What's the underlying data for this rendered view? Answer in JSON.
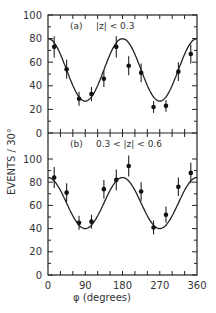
{
  "chart_data": [
    {
      "type": "scatter",
      "panel": "(a)",
      "label": "|z| < 0.3",
      "x": [
        15,
        45,
        75,
        105,
        135,
        165,
        195,
        225,
        255,
        285,
        315,
        345
      ],
      "values": [
        73,
        54,
        29,
        33,
        46,
        73,
        57,
        51,
        22,
        23,
        52,
        67
      ],
      "errors": [
        9,
        8,
        6,
        6,
        7,
        9,
        8,
        8,
        5,
        5,
        8,
        8
      ],
      "fit": {
        "type": "line",
        "form": "A + B*cos(2*phi)",
        "max": 80,
        "min": 27
      },
      "xlabel": "φ (degrees)",
      "ylabel": "EVENTS / 30°",
      "xlim": [
        0,
        360
      ],
      "ylim": [
        0,
        100
      ],
      "xticks": [
        "0",
        "90",
        "180",
        "270",
        "360"
      ],
      "yticks": [
        "0",
        "20",
        "40",
        "60",
        "80",
        "100"
      ]
    },
    {
      "type": "scatter",
      "panel": "(b)",
      "label": "0.3 < |z| < 0.6",
      "x": [
        15,
        45,
        75,
        105,
        135,
        165,
        195,
        225,
        255,
        285,
        315,
        345
      ],
      "values": [
        84,
        71,
        45,
        46,
        74,
        82,
        94,
        72,
        41,
        52,
        76,
        88
      ],
      "errors": [
        9,
        8,
        6,
        6,
        8,
        9,
        9,
        8,
        6,
        7,
        8,
        9
      ],
      "fit": {
        "type": "line",
        "form": "A + B*cos(2*phi)",
        "max": 84,
        "min": 40
      },
      "xlabel": "φ (degrees)",
      "ylabel": "EVENTS / 30°",
      "xlim": [
        0,
        360
      ],
      "ylim": [
        0,
        110
      ],
      "xticks": [
        "0",
        "90",
        "180",
        "270",
        "360"
      ],
      "yticks": [
        "0",
        "20",
        "40",
        "60",
        "80",
        "100"
      ]
    }
  ],
  "labels": {
    "ylabel": "EVENTS / 30°",
    "xlabel": "φ (degrees)",
    "panel_a": "(a)",
    "panel_a_cut": "|z| < 0.3",
    "panel_b": "(b)",
    "panel_b_cut": "0.3 < |z| < 0.6"
  }
}
